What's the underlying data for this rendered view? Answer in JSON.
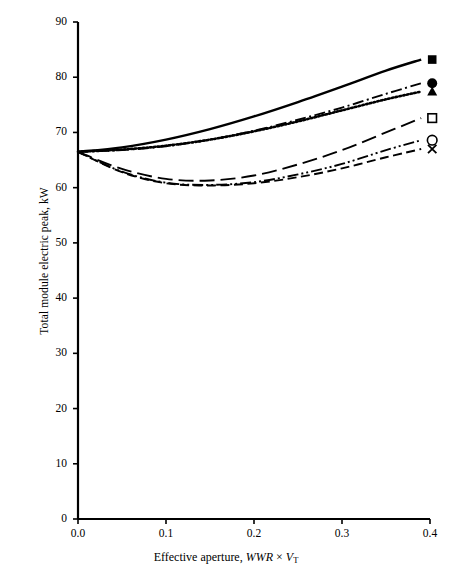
{
  "chart_data": {
    "type": "line",
    "title": "",
    "xlabel_plain": "Effective aperture, WWR × V_T",
    "xlabel_parts": {
      "prefix": "Effective aperture, ",
      "wwr": "WWR",
      "times": "×",
      "v": "V",
      "sub": "T"
    },
    "ylabel": "Total module electric peak, kW",
    "xlim": [
      0.0,
      0.4
    ],
    "ylim": [
      0,
      90
    ],
    "xticks": [
      "0.0",
      "0.1",
      "0.2",
      "0.3",
      "0.4"
    ],
    "xtick_values": [
      0.0,
      0.1,
      0.2,
      0.3,
      0.4
    ],
    "yticks": [
      "0",
      "10",
      "20",
      "30",
      "40",
      "50",
      "60",
      "70",
      "80",
      "90"
    ],
    "ytick_values": [
      0,
      10,
      20,
      30,
      40,
      50,
      60,
      70,
      80,
      90
    ],
    "grid": false,
    "legend_position": "none",
    "frame": "left-bottom-only",
    "line_color": "#000000",
    "x": [
      0.0,
      0.05,
      0.1,
      0.15,
      0.2,
      0.25,
      0.3,
      0.35,
      0.39
    ],
    "series": [
      {
        "name": "series-filled-square",
        "marker": "filled-square",
        "linestyle": "solid",
        "end_label_value": 83.2,
        "values": [
          66.5,
          67.3,
          68.7,
          70.6,
          72.9,
          75.5,
          78.3,
          81.2,
          83.2
        ]
      },
      {
        "name": "series-filled-circle",
        "marker": "filled-circle",
        "linestyle": "dash-dot",
        "end_label_value": 78.9,
        "values": [
          66.5,
          66.8,
          67.5,
          68.7,
          70.3,
          72.3,
          74.5,
          77.0,
          78.9
        ]
      },
      {
        "name": "series-filled-triangle",
        "marker": "filled-triangle",
        "linestyle": "dotted",
        "end_label_value": 77.4,
        "values": [
          66.5,
          66.9,
          67.6,
          68.7,
          70.2,
          72.0,
          74.0,
          76.0,
          77.4
        ]
      },
      {
        "name": "series-open-square",
        "marker": "open-square",
        "linestyle": "long-dash",
        "end_label_value": 72.6,
        "values": [
          66.5,
          63.4,
          61.6,
          61.3,
          62.2,
          64.2,
          66.8,
          70.0,
          72.6
        ]
      },
      {
        "name": "series-open-circle",
        "marker": "open-circle",
        "linestyle": "dash-dot-dot",
        "end_label_value": 68.6,
        "values": [
          66.5,
          62.9,
          60.9,
          60.5,
          61.0,
          62.4,
          64.3,
          66.8,
          68.6
        ]
      },
      {
        "name": "series-cross",
        "marker": "cross-x",
        "linestyle": "dashed",
        "end_label_value": 67.0,
        "values": [
          66.5,
          62.8,
          60.8,
          60.4,
          60.8,
          61.9,
          63.5,
          65.5,
          67.0
        ]
      }
    ]
  }
}
